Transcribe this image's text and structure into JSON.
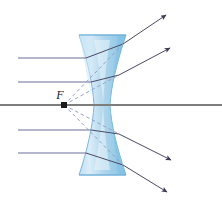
{
  "figure": {
    "canvas": {
      "width": 222,
      "height": 208,
      "background": "#ffffff"
    },
    "labels": {
      "focal_point": "F"
    },
    "colors": {
      "incident_ray": "#6b6f9c",
      "axis_ray": "#7d7d7d",
      "refracted_ray": "#4a4a63",
      "virtual_ray_dashed": "#9aa0c4",
      "lens_fill_light": "#e8f4fb",
      "lens_fill_mid": "#bcdcf0",
      "lens_fill_deep": "#8dc5e6",
      "lens_outline": "#7cb8dd",
      "focal_dot": "#1a1a1a",
      "label_text": "#1a1a1a"
    },
    "optical_axis": {
      "name": "optical-axis",
      "y": 105,
      "x_start": 0,
      "x_end": 222
    },
    "focal_point": {
      "name": "focal-point",
      "x": 64,
      "y": 105,
      "dot_radius": 3,
      "label": "F",
      "label_x": 62,
      "label_y": 99
    },
    "lens": {
      "name": "biconcave-lens",
      "top_y": 35,
      "bottom_y": 175,
      "top_left_x": 79,
      "top_right_x": 126,
      "bottom_left_x": 79,
      "bottom_right_x": 126,
      "waist_left_x": 94,
      "waist_right_x": 110,
      "waist_y": 105
    },
    "incident_rays": [
      {
        "name": "incident-ray-1",
        "y": 58,
        "x_start": 18,
        "x_end": 86
      },
      {
        "name": "incident-ray-2",
        "y": 82,
        "x_start": 18,
        "x_end": 91
      },
      {
        "name": "incident-ray-3",
        "y": 105,
        "x_start": 0,
        "x_end": 222,
        "is_axis": true
      },
      {
        "name": "incident-ray-4",
        "y": 130,
        "x_start": 18,
        "x_end": 91
      },
      {
        "name": "incident-ray-5",
        "y": 153,
        "x_start": 18,
        "x_end": 86
      }
    ],
    "refracted_rays": [
      {
        "name": "refracted-ray-1",
        "x1": 123,
        "y1": 44,
        "x2": 168,
        "y2": 13
      },
      {
        "name": "refracted-ray-2",
        "x1": 119,
        "y1": 75,
        "x2": 172,
        "y2": 46
      },
      {
        "name": "refracted-ray-3",
        "x1": 119,
        "y1": 134,
        "x2": 173,
        "y2": 162
      },
      {
        "name": "refracted-ray-4",
        "x1": 123,
        "y1": 165,
        "x2": 169,
        "y2": 195
      }
    ],
    "virtual_rays_dashed": [
      {
        "name": "virtual-ray-1",
        "x1": 64,
        "y1": 105,
        "x2": 123,
        "y2": 44
      },
      {
        "name": "virtual-ray-2",
        "x1": 64,
        "y1": 105,
        "x2": 119,
        "y2": 75
      },
      {
        "name": "virtual-ray-3",
        "x1": 64,
        "y1": 105,
        "x2": 119,
        "y2": 134
      },
      {
        "name": "virtual-ray-4",
        "x1": 64,
        "y1": 105,
        "x2": 123,
        "y2": 165
      }
    ],
    "internal_segments": [
      {
        "name": "internal-segment-1",
        "x1": 86,
        "y1": 58,
        "x2": 123,
        "y2": 44
      },
      {
        "name": "internal-segment-2",
        "x1": 91,
        "y1": 82,
        "x2": 119,
        "y2": 75
      },
      {
        "name": "internal-segment-3",
        "x1": 91,
        "y1": 130,
        "x2": 119,
        "y2": 134
      },
      {
        "name": "internal-segment-4",
        "x1": 86,
        "y1": 153,
        "x2": 123,
        "y2": 165
      }
    ]
  }
}
